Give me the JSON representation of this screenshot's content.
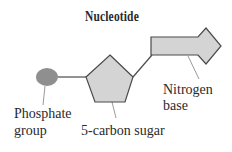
{
  "diagram": {
    "title": "Nucleotide",
    "labels": {
      "phosphate_line1": "Phosphate",
      "phosphate_line2": "group",
      "sugar": "5-carbon sugar",
      "base_line1": "Nitrogen",
      "base_line2": "base"
    },
    "colors": {
      "phosphate_fill": "#8f8f8f",
      "shape_fill": "#d4d4d4",
      "stroke": "#4a4a4a",
      "leader_line": "#9a9a9a",
      "text": "#2a2a2a"
    },
    "parts": [
      "phosphate-group",
      "5-carbon-sugar",
      "nitrogen-base"
    ]
  }
}
